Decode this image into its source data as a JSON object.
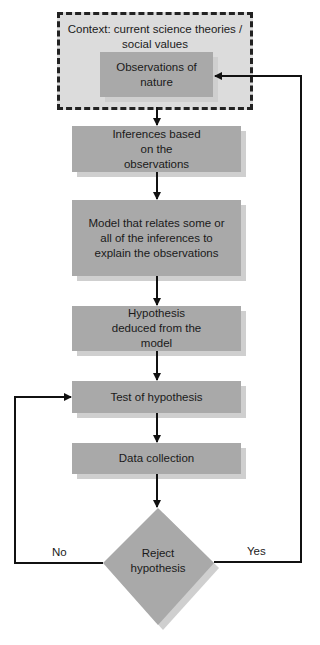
{
  "diagram": {
    "type": "flowchart",
    "context": {
      "label": "Context: current science theories / social values"
    },
    "nodes": [
      {
        "id": "observations",
        "label": "Observations of nature"
      },
      {
        "id": "inferences",
        "label": "Inferences based on the observations"
      },
      {
        "id": "model",
        "label": "Model that relates some or all of the inferences to explain the observations"
      },
      {
        "id": "hypothesis",
        "label": "Hypothesis deduced from the model"
      },
      {
        "id": "test",
        "label": "Test of hypothesis"
      },
      {
        "id": "data",
        "label": "Data collection"
      },
      {
        "id": "decision",
        "label": "Reject hypothesis",
        "shape": "diamond"
      }
    ],
    "edges": [
      {
        "from": "observations",
        "to": "inferences"
      },
      {
        "from": "inferences",
        "to": "model"
      },
      {
        "from": "model",
        "to": "hypothesis"
      },
      {
        "from": "hypothesis",
        "to": "test"
      },
      {
        "from": "test",
        "to": "data"
      },
      {
        "from": "data",
        "to": "decision"
      },
      {
        "from": "decision",
        "to": "observations",
        "label": "Yes"
      },
      {
        "from": "decision",
        "to": "test",
        "label": "No"
      }
    ],
    "branch_labels": {
      "no": "No",
      "yes": "Yes"
    },
    "colors": {
      "box": "#a9a9a9",
      "shadow": "#cfcfcf",
      "context_bg": "#dcdcdc",
      "line": "#111111"
    }
  }
}
